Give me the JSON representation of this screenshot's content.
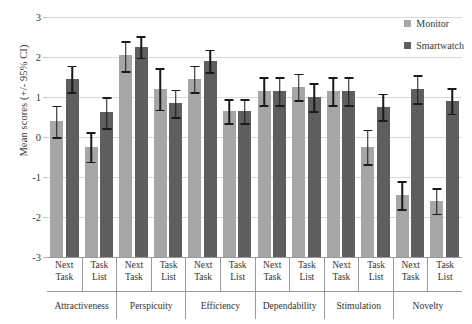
{
  "chart_data": {
    "type": "bar",
    "title": "",
    "xlabel": "",
    "ylabel": "Mean scores (+/- 95% CI)",
    "ylim": [
      -3,
      3
    ],
    "yticks": [
      3,
      2,
      1,
      0,
      -1,
      -2,
      -3
    ],
    "ytick_labels": [
      "3",
      "2",
      "1",
      "0",
      "-1",
      "-2",
      "-3"
    ],
    "grid": true,
    "legend_position": "top-right",
    "legend": [
      "Monitor",
      "Smartwatch"
    ],
    "group_labels": [
      "Attractiveness",
      "Perspicuity",
      "Efficiency",
      "Dependability",
      "Stimulation",
      "Novelty"
    ],
    "subgroup_labels": [
      "Next Task",
      "Task List"
    ],
    "subgroup_label_lines": [
      [
        "Next",
        "Task"
      ],
      [
        "Task",
        "List"
      ]
    ],
    "categories": [
      "Attractiveness / Next Task",
      "Attractiveness / Task List",
      "Perspicuity / Next Task",
      "Perspicuity / Task List",
      "Efficiency / Next Task",
      "Efficiency / Task List",
      "Dependability / Next Task",
      "Dependability / Task List",
      "Stimulation / Next Task",
      "Stimulation / Task List",
      "Novelty / Next Task",
      "Novelty / Task List"
    ],
    "series": [
      {
        "name": "Monitor",
        "color": "#a6a6a6",
        "values": [
          0.4,
          -0.25,
          2.05,
          1.2,
          1.45,
          0.65,
          1.15,
          1.25,
          1.15,
          -0.25,
          -1.45,
          -1.6
        ],
        "ci_upper": [
          0.78,
          0.12,
          2.4,
          1.72,
          1.78,
          0.95,
          1.5,
          1.58,
          1.5,
          0.18,
          -1.1,
          -1.28
        ],
        "ci_lower": [
          0.0,
          -0.62,
          1.65,
          0.68,
          1.12,
          0.35,
          0.8,
          0.92,
          0.8,
          -0.68,
          -1.8,
          -1.92
        ]
      },
      {
        "name": "Smartwatch",
        "color": "#5e5e5e",
        "values": [
          1.45,
          0.62,
          2.25,
          0.85,
          1.9,
          0.65,
          1.15,
          1.0,
          1.15,
          0.75,
          1.2,
          0.9
        ],
        "ci_upper": [
          1.78,
          1.0,
          2.52,
          1.18,
          2.18,
          0.95,
          1.5,
          1.35,
          1.5,
          1.08,
          1.55,
          1.22
        ],
        "ci_lower": [
          1.12,
          0.22,
          1.98,
          0.5,
          1.62,
          0.35,
          0.8,
          0.65,
          0.8,
          0.42,
          0.85,
          0.58
        ]
      }
    ]
  }
}
